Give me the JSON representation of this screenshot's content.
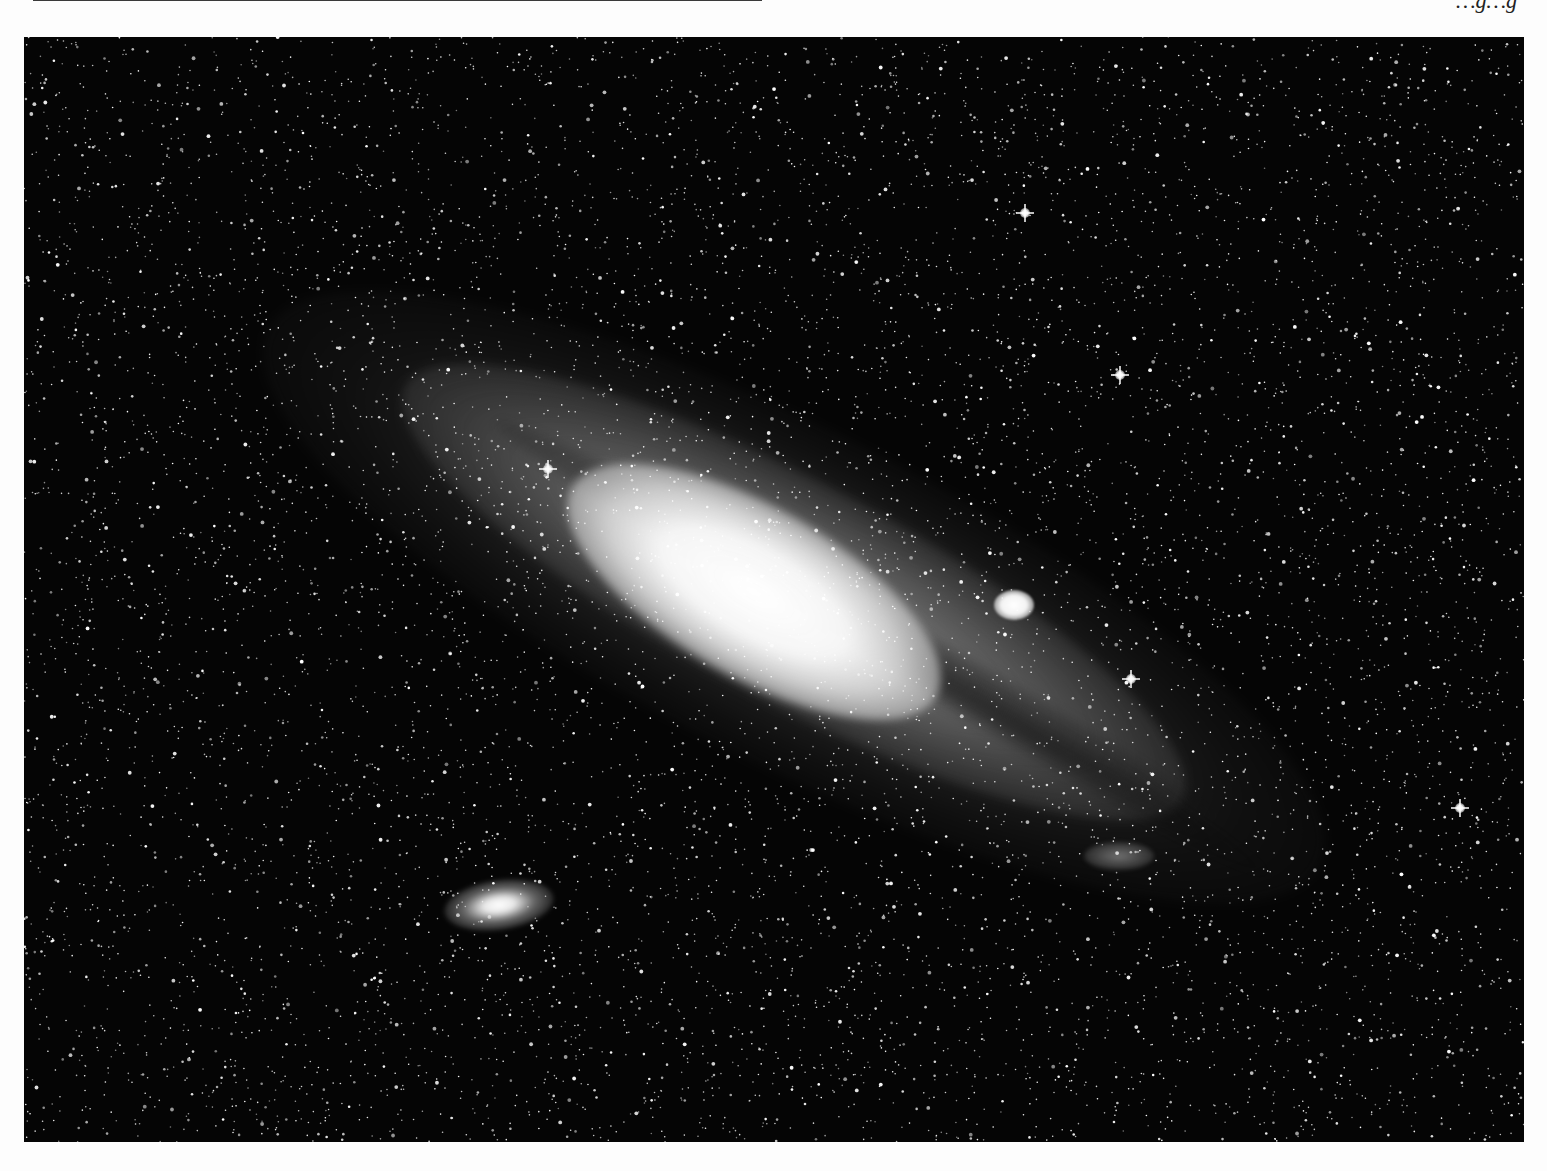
{
  "page": {
    "background": "#fdfdfd",
    "running_head_partial": "…g…g",
    "top_box": {
      "visible": "bottom edge only",
      "border_color": "#3a3a3a"
    }
  },
  "photo": {
    "subject": "spiral galaxy (Andromeda, M31) with two satellite galaxies",
    "style": "black-and-white astrophotograph",
    "background_color": "#050505",
    "features": [
      {
        "name": "galaxy-core",
        "desc": "bright elongated central bulge"
      },
      {
        "name": "galaxy-disk",
        "desc": "tilted disk with dark dust lanes, oriented from upper-left to lower-right"
      },
      {
        "name": "satellite-compact",
        "desc": "small bright round satellite galaxy right of the core"
      },
      {
        "name": "satellite-elliptical",
        "desc": "elongated elliptical satellite galaxy lower-left"
      },
      {
        "name": "foreground-stars",
        "desc": "dense field of foreground stars, several with diffraction spikes"
      }
    ],
    "bright_stars": [
      {
        "x": 1001,
        "y": 176
      },
      {
        "x": 1096,
        "y": 338
      },
      {
        "x": 1107,
        "y": 642
      },
      {
        "x": 1436,
        "y": 771
      },
      {
        "x": 524,
        "y": 432
      }
    ]
  }
}
